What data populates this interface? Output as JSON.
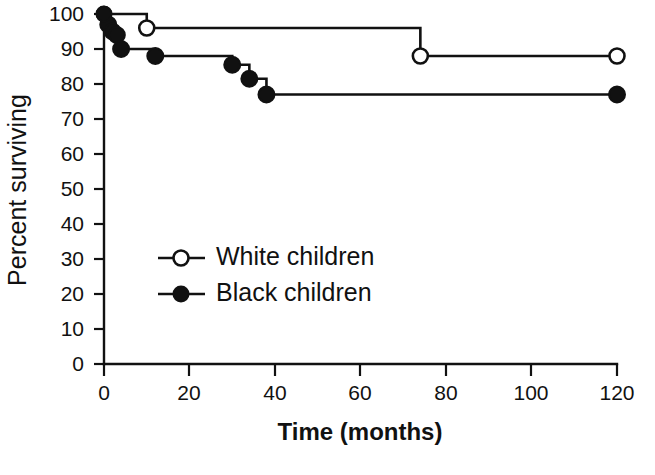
{
  "chart_data": {
    "type": "line",
    "title": "",
    "xlabel": "Time (months)",
    "ylabel": "Percent surviving",
    "xlim": [
      0,
      120
    ],
    "ylim": [
      0,
      100
    ],
    "xticks": [
      0,
      20,
      40,
      60,
      80,
      100,
      120
    ],
    "yticks": [
      0,
      10,
      20,
      30,
      40,
      50,
      60,
      70,
      80,
      90,
      100
    ],
    "xtick_labels": [
      "0",
      "20",
      "40",
      "60",
      "80",
      "100",
      "120"
    ],
    "ytick_labels": [
      "0",
      "10",
      "20",
      "30",
      "40",
      "50",
      "60",
      "70",
      "80",
      "90",
      "100"
    ],
    "grid": false,
    "legend_position": "inside-left-lower",
    "step_style": "post",
    "series": [
      {
        "name": "White children",
        "marker": "open-circle",
        "color": "#111111",
        "x": [
          0,
          10,
          74,
          120
        ],
        "y": [
          100,
          96,
          88,
          88
        ],
        "points": [
          {
            "x": 0,
            "y": 100
          },
          {
            "x": 10,
            "y": 96
          },
          {
            "x": 74,
            "y": 88
          },
          {
            "x": 120,
            "y": 88
          }
        ]
      },
      {
        "name": "Black children",
        "marker": "filled-circle",
        "color": "#111111",
        "x": [
          0,
          1,
          2,
          3,
          4,
          12,
          30,
          34,
          38,
          120
        ],
        "y": [
          100,
          97,
          95,
          94,
          90,
          88,
          85.5,
          81.5,
          77,
          77
        ],
        "points": [
          {
            "x": 0,
            "y": 100
          },
          {
            "x": 1,
            "y": 97
          },
          {
            "x": 2,
            "y": 95
          },
          {
            "x": 3,
            "y": 94
          },
          {
            "x": 4,
            "y": 90
          },
          {
            "x": 12,
            "y": 88
          },
          {
            "x": 30,
            "y": 85.5
          },
          {
            "x": 34,
            "y": 81.5
          },
          {
            "x": 38,
            "y": 77
          },
          {
            "x": 120,
            "y": 77
          }
        ]
      }
    ],
    "legend": [
      {
        "label": "White children",
        "marker": "open-circle"
      },
      {
        "label": "Black children",
        "marker": "filled-circle"
      }
    ]
  }
}
